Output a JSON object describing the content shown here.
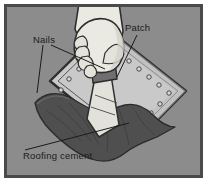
{
  "figure": {
    "frame": {
      "border_color": "#4a4a4a",
      "background_color": "#8c8c8c",
      "outer_margin_color": "#ffffff"
    }
  },
  "callouts": [
    {
      "id": "nails",
      "label": "Nails",
      "text_x": 30,
      "text_y": 38,
      "leaders": [
        {
          "x1": 40,
          "y1": 42,
          "x2": 32,
          "y2": 86
        },
        {
          "x1": 44,
          "y1": 42,
          "x2": 96,
          "y2": 62
        }
      ]
    },
    {
      "id": "patch",
      "label": "Patch",
      "text_x": 122,
      "text_y": 26,
      "leaders": [
        {
          "x1": 133,
          "y1": 30,
          "x2": 112,
          "y2": 68
        }
      ]
    },
    {
      "id": "roofing-cement",
      "label": "Roofing cement",
      "text_x": 20,
      "text_y": 151,
      "leaders": [
        {
          "x1": 22,
          "y1": 145,
          "x2": 124,
          "y2": 118
        }
      ]
    }
  ],
  "scene": {
    "patch": {
      "name": "asphalt-patch",
      "fill": "#c9c9c9",
      "outline": "#2e2e2e",
      "points": "43,74 98,20 179,84 124,140"
    },
    "patch_inner": {
      "fill": "none",
      "outline": "#3d3d3d",
      "points": "50,74 98,28 171,84 124,131"
    },
    "roofing_cement": {
      "name": "roofing-cement-blob",
      "fill": "#4f4f4f",
      "outline": "#2b2b2b"
    },
    "hand": {
      "name": "hand-holding-trowel",
      "skin_fill": "#ebeae2",
      "outline": "#2e2e2e",
      "cuff_fill": "#6f6f6f"
    },
    "trowel": {
      "name": "trowel-blade",
      "fill": "#e2e1da",
      "outline": "#2e2e2e"
    },
    "nails": {
      "fill": "#d8d8d8",
      "outline": "#3a3a3a",
      "positions": [
        [
          60,
          72
        ],
        [
          70,
          62
        ],
        [
          80,
          52
        ],
        [
          90,
          42
        ],
        [
          108,
          46
        ],
        [
          118,
          54
        ],
        [
          128,
          62
        ],
        [
          138,
          70
        ],
        [
          148,
          78
        ],
        [
          158,
          86
        ],
        [
          150,
          98
        ],
        [
          140,
          108
        ],
        [
          130,
          118
        ],
        [
          120,
          128
        ],
        [
          52,
          84
        ],
        [
          62,
          94
        ],
        [
          72,
          104
        ],
        [
          84,
          114
        ]
      ]
    }
  }
}
